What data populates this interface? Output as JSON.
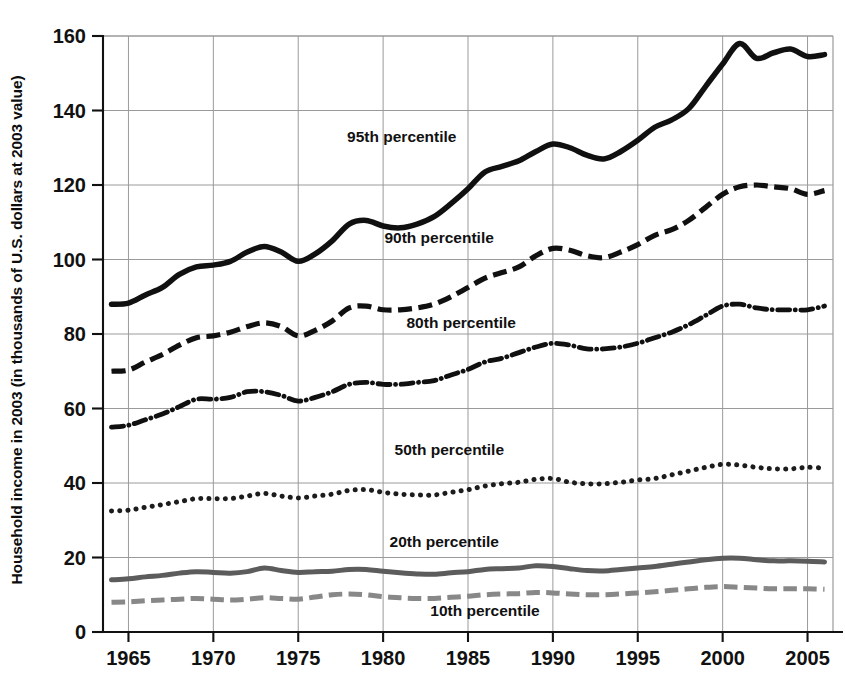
{
  "chart_data": {
    "type": "line",
    "title": "",
    "xlabel": "",
    "ylabel": "Household income in 2003 (in thousands of U.S. dollars at 2003 value)",
    "xlim": [
      1963.5,
      2006.5
    ],
    "ylim": [
      0,
      160
    ],
    "yticks": [
      0,
      20,
      40,
      60,
      80,
      100,
      120,
      140,
      160
    ],
    "xticks": [
      1965,
      1970,
      1975,
      1980,
      1985,
      1990,
      1995,
      2000,
      2005
    ],
    "grid": true,
    "legend_position": "inline-annotations",
    "x": [
      1964,
      1965,
      1966,
      1967,
      1968,
      1969,
      1970,
      1971,
      1972,
      1973,
      1974,
      1975,
      1976,
      1977,
      1978,
      1979,
      1980,
      1981,
      1982,
      1983,
      1984,
      1985,
      1986,
      1987,
      1988,
      1989,
      1990,
      1991,
      1992,
      1993,
      1994,
      1995,
      1996,
      1997,
      1998,
      1999,
      2000,
      2001,
      2002,
      2003,
      2004,
      2005,
      2006
    ],
    "series": [
      {
        "name": "95th percentile",
        "style": "solid",
        "color": "#101010",
        "width": 5.5,
        "label_x": 1981.1,
        "label_y": 131.5,
        "values": [
          88.0,
          88.3,
          90.5,
          92.5,
          96.0,
          98.0,
          98.5,
          99.5,
          102.0,
          103.5,
          102.0,
          99.5,
          101.5,
          105.0,
          109.5,
          110.5,
          109.0,
          108.5,
          109.5,
          111.5,
          115.0,
          119.0,
          123.5,
          125.0,
          126.5,
          129.0,
          131.0,
          130.0,
          128.0,
          127.0,
          129.0,
          132.0,
          135.5,
          137.5,
          140.5,
          146.5,
          152.5,
          158.0,
          154.0,
          155.5,
          156.5,
          154.5,
          155.0
        ]
      },
      {
        "name": "90th percentile",
        "style": "dashed",
        "color": "#101010",
        "width": 5.2,
        "label_x": 1983.3,
        "label_y": 104.5,
        "values": [
          70.0,
          70.3,
          72.5,
          74.5,
          77.0,
          79.0,
          79.5,
          80.5,
          82.0,
          83.0,
          82.0,
          79.5,
          81.0,
          83.5,
          87.0,
          87.5,
          86.5,
          86.5,
          87.0,
          88.0,
          90.0,
          92.5,
          95.0,
          96.5,
          98.0,
          101.0,
          103.0,
          102.5,
          101.0,
          100.5,
          102.0,
          104.0,
          106.5,
          108.0,
          110.5,
          114.0,
          117.5,
          119.5,
          120.0,
          119.5,
          119.0,
          117.5,
          118.5
        ]
      },
      {
        "name": "80th percentile",
        "style": "dashdot",
        "color": "#101010",
        "width": 4.8,
        "label_x": 1984.6,
        "label_y": 81.5,
        "values": [
          55.0,
          55.5,
          57.0,
          58.5,
          60.5,
          62.5,
          62.5,
          63.0,
          64.5,
          64.5,
          63.5,
          62.0,
          63.0,
          64.5,
          66.5,
          67.0,
          66.5,
          66.5,
          67.0,
          67.5,
          69.0,
          70.5,
          72.5,
          73.5,
          75.0,
          76.5,
          77.5,
          77.0,
          76.0,
          76.0,
          76.5,
          77.5,
          79.0,
          80.5,
          82.5,
          85.0,
          87.5,
          88.0,
          87.0,
          86.5,
          86.5,
          86.5,
          87.5
        ]
      },
      {
        "name": "50th percentile",
        "style": "dotted",
        "color": "#1c1c1c",
        "width": 5.0,
        "label_x": 1983.9,
        "label_y": 47.5,
        "values": [
          32.5,
          32.7,
          33.5,
          34.2,
          35.0,
          35.8,
          35.8,
          35.8,
          36.5,
          37.2,
          36.5,
          36.0,
          36.5,
          37.0,
          38.0,
          38.2,
          37.5,
          37.0,
          36.8,
          36.8,
          37.5,
          38.2,
          39.2,
          39.8,
          40.2,
          41.0,
          41.2,
          40.2,
          39.8,
          39.8,
          40.2,
          40.8,
          41.2,
          42.2,
          43.2,
          44.2,
          45.0,
          44.8,
          44.2,
          43.8,
          43.8,
          44.2,
          44.0
        ]
      },
      {
        "name": "20th percentile",
        "style": "solid",
        "color": "#5c5c5c",
        "width": 5.0,
        "label_x": 1983.6,
        "label_y": 22.8,
        "values": [
          14.0,
          14.3,
          14.8,
          15.2,
          15.8,
          16.2,
          16.0,
          15.8,
          16.2,
          17.2,
          16.5,
          16.0,
          16.2,
          16.3,
          16.8,
          16.8,
          16.3,
          15.9,
          15.6,
          15.5,
          15.9,
          16.2,
          16.8,
          17.0,
          17.2,
          17.8,
          17.6,
          17.0,
          16.5,
          16.4,
          16.8,
          17.2,
          17.6,
          18.2,
          18.8,
          19.4,
          19.8,
          19.8,
          19.4,
          19.1,
          19.1,
          19.0,
          18.8
        ]
      },
      {
        "name": "10th percentile",
        "style": "dashed",
        "color": "#888888",
        "width": 5.0,
        "label_x": 1986.0,
        "label_y": 4.2,
        "values": [
          8.0,
          8.1,
          8.4,
          8.6,
          8.8,
          9.0,
          8.8,
          8.6,
          8.8,
          9.2,
          9.0,
          8.8,
          9.4,
          10.0,
          10.2,
          10.0,
          9.5,
          9.2,
          9.0,
          9.0,
          9.3,
          9.6,
          10.0,
          10.2,
          10.3,
          10.6,
          10.5,
          10.2,
          10.0,
          10.0,
          10.2,
          10.5,
          10.8,
          11.2,
          11.6,
          12.0,
          12.2,
          12.0,
          11.8,
          11.6,
          11.6,
          11.6,
          11.5
        ]
      }
    ]
  },
  "axis": {
    "ytick_labels": [
      "0",
      "20",
      "40",
      "60",
      "80",
      "100",
      "120",
      "140",
      "160"
    ],
    "xtick_labels": [
      "1965",
      "1970",
      "1975",
      "1980",
      "1985",
      "1990",
      "1995",
      "2000",
      "2005"
    ]
  },
  "colors": {
    "background": "#ffffff",
    "grid": "#9a9a9a",
    "axis": "#111111",
    "dark_line": "#101010",
    "mid_gray_line": "#5c5c5c",
    "light_gray_line": "#888888"
  }
}
